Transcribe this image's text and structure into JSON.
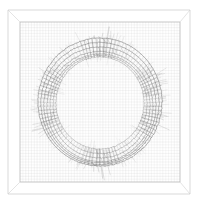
{
  "figure": {
    "title": "",
    "background_color": "#ffffff",
    "width": 198,
    "height": 206,
    "render_style": "wireframe-line-art",
    "colors": {
      "outer_box": "#c9c9c9",
      "inner_box": "#b8b8b8",
      "depth_edge": "#d2d2d2",
      "grid": "#cfcfcf",
      "ring": "#5a5a5a",
      "spoke": "#6b6b6b",
      "hatch": "#7a7a7a",
      "spike": "#8a8a8a"
    }
  },
  "box": {
    "outer": {
      "x": 8,
      "y": 10,
      "width": 182,
      "height": 184
    },
    "inner": {
      "x": 20,
      "y": 22,
      "width": 160,
      "height": 160
    },
    "perspective_corners": 4
  },
  "grid": {
    "visible": true,
    "columns": 56,
    "rows": 56,
    "x_start": 20,
    "x_end": 180,
    "y_start": 22,
    "y_end": 182
  },
  "chart_data": {
    "type": "line",
    "title": "",
    "subtitle": "",
    "xlabel": "",
    "ylabel": "",
    "legend": [],
    "grid": true,
    "xlim": [
      20,
      180
    ],
    "ylim": [
      22,
      182
    ],
    "projection": "3d-perspective-box",
    "surface": "torus-annulus-mesh",
    "center": {
      "cx": 100,
      "cy": 102
    },
    "rings": {
      "count": 7,
      "radii_x": [
        62,
        59,
        56,
        53,
        50,
        47,
        44
      ],
      "radii_y": [
        64,
        61,
        58,
        55,
        52,
        49,
        46
      ],
      "y_offsets": [
        0,
        1.5,
        3,
        4.5,
        4,
        2.5,
        1
      ]
    },
    "spokes": {
      "count": 96,
      "inner_fraction": 0.7,
      "outer_fraction": 1.03
    },
    "hatch": {
      "count": 150,
      "amplitude": 6
    },
    "spikes": {
      "count": 130,
      "max_length": 11
    },
    "hot_spots": [
      {
        "angle_deg": 270,
        "label": "top-cluster",
        "intensity": 0.95
      },
      {
        "angle_deg": 90,
        "label": "bottom-cluster",
        "intensity": 0.9
      },
      {
        "angle_deg": 200,
        "label": "upper-left-cluster",
        "intensity": 0.7
      },
      {
        "angle_deg": 340,
        "label": "upper-right-cluster",
        "intensity": 0.65
      },
      {
        "angle_deg": 160,
        "label": "lower-left-cluster",
        "intensity": 0.6
      },
      {
        "angle_deg": 20,
        "label": "right-cluster",
        "intensity": 0.6
      }
    ]
  }
}
